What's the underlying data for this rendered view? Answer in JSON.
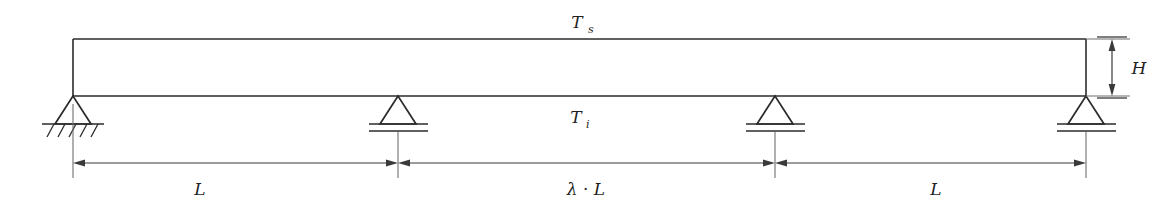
{
  "diagram": {
    "colors": {
      "line": "#2b2b2b",
      "dimension": "#3a3a3a",
      "extension": "#6f6f6f",
      "background": "#ffffff"
    },
    "labels": {
      "top_temperature": "T",
      "top_temperature_sub": "s",
      "bottom_temperature": "T",
      "bottom_temperature_sub": "i",
      "height": "H",
      "span_left": "L",
      "span_middle": "λ · L",
      "span_right": "L"
    },
    "supports": [
      {
        "name": "support-pinned-left",
        "type": "pinned",
        "x": 73
      },
      {
        "name": "support-roller-2",
        "type": "roller",
        "x": 398
      },
      {
        "name": "support-roller-3",
        "type": "roller",
        "x": 775
      },
      {
        "name": "support-roller-right",
        "type": "roller",
        "x": 1086
      }
    ],
    "dimensions": [
      {
        "name": "dimension-span-left",
        "label": "L",
        "from": 73,
        "to": 398
      },
      {
        "name": "dimension-span-middle",
        "label": "λ · L",
        "from": 398,
        "to": 775
      },
      {
        "name": "dimension-span-right",
        "label": "L",
        "from": 775,
        "to": 1086
      },
      {
        "name": "dimension-height",
        "label": "H",
        "from": 39,
        "to": 96
      }
    ],
    "beam": {
      "left": 73,
      "right": 1086,
      "top": 39,
      "bottom": 96
    }
  }
}
